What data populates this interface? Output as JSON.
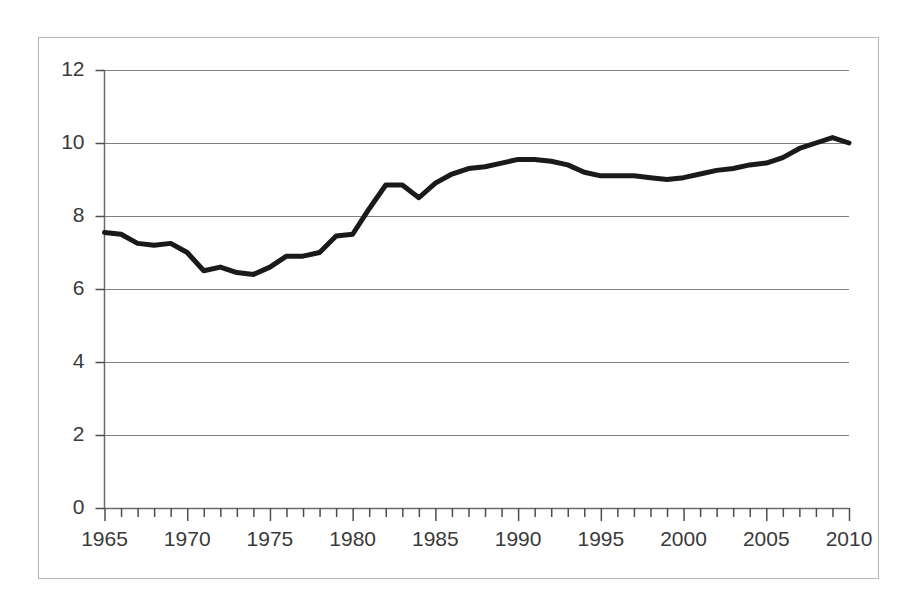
{
  "chart_data": {
    "type": "line",
    "title": "",
    "subtitle": "",
    "xlabel": "",
    "ylabel": "",
    "xlim": [
      1965,
      2010
    ],
    "ylim": [
      0,
      12
    ],
    "y_ticks": [
      0,
      2,
      4,
      6,
      8,
      10,
      12
    ],
    "x_ticks": [
      1965,
      1970,
      1975,
      1980,
      1985,
      1990,
      1995,
      2000,
      2005,
      2010
    ],
    "x_minor_tick_interval": 1,
    "grid": "horizontal",
    "legend": "none",
    "annotations": [],
    "series": [
      {
        "name": "series-1",
        "color": "#1a1a1a",
        "line_width": 5,
        "x": [
          1965,
          1966,
          1967,
          1968,
          1969,
          1970,
          1971,
          1972,
          1973,
          1974,
          1975,
          1976,
          1977,
          1978,
          1979,
          1980,
          1981,
          1982,
          1983,
          1984,
          1985,
          1986,
          1987,
          1988,
          1989,
          1990,
          1991,
          1992,
          1993,
          1994,
          1995,
          1996,
          1997,
          1998,
          1999,
          2000,
          2001,
          2002,
          2003,
          2004,
          2005,
          2006,
          2007,
          2008,
          2009,
          2010
        ],
        "values": [
          7.55,
          7.5,
          7.25,
          7.2,
          7.25,
          7.0,
          6.5,
          6.6,
          6.45,
          6.4,
          6.6,
          6.9,
          6.9,
          7.0,
          7.45,
          7.5,
          8.2,
          8.85,
          8.85,
          8.5,
          8.9,
          9.15,
          9.3,
          9.35,
          9.45,
          9.55,
          9.55,
          9.5,
          9.4,
          9.2,
          9.1,
          9.1,
          9.1,
          9.05,
          9.0,
          9.05,
          9.15,
          9.25,
          9.3,
          9.4,
          9.45,
          9.6,
          9.85,
          10.0,
          10.15,
          10.0
        ]
      }
    ]
  },
  "axes": {
    "y_tick_labels": [
      "0",
      "2",
      "4",
      "6",
      "8",
      "10",
      "12"
    ],
    "x_tick_labels": [
      "1965",
      "1970",
      "1975",
      "1980",
      "1985",
      "1990",
      "1995",
      "2000",
      "2005",
      "2010"
    ]
  },
  "style": {
    "frame_color": "#b0b0b0",
    "grid_color": "#808080",
    "axis_color": "#4d4d4d",
    "line_color": "#1a1a1a",
    "background": "#ffffff",
    "text_color": "#3a3a3a"
  }
}
